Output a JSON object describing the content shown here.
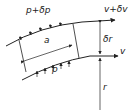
{
  "diagram": {
    "type": "curved streamline fluid element",
    "labels": {
      "top_pressure": "p+δp",
      "bottom_pressure": "p",
      "top_velocity": "v+δv",
      "bottom_velocity": "v",
      "element_length": "a",
      "thickness": "δr",
      "radius": "r"
    },
    "colors": {
      "line": "#222222",
      "background": "#ffffff"
    }
  }
}
